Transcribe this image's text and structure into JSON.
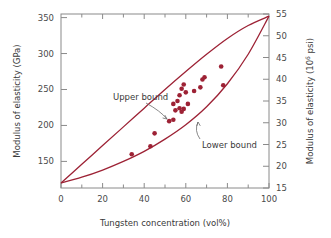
{
  "chart_data": {
    "type": "scatter",
    "title": "",
    "xlabel": "Tungsten concentration (vol%)",
    "ylabel": "Modulus of elasticity (GPa)",
    "ylabel_right": "Modulus of elasticity (10⁶ psi)",
    "ylabel_right_base": "Modulus of elasticity (10",
    "ylabel_right_exp": "6",
    "ylabel_right_tail": " psi)",
    "xlim": [
      0,
      100
    ],
    "ylim": [
      113,
      355
    ],
    "ylim_right": [
      15,
      55
    ],
    "grid": false,
    "legend_position": "inline-annotations",
    "accent_color": "#9d2235",
    "axis_color": "#8a8a8a",
    "text_color": "#3a3a3a",
    "xticks": [
      0,
      20,
      40,
      60,
      80,
      100
    ],
    "xticks_minor": [
      10,
      30,
      50,
      70,
      90
    ],
    "yticks_left": [
      150,
      200,
      250,
      300,
      350
    ],
    "yticks_right": [
      15,
      20,
      25,
      30,
      35,
      40,
      45,
      50,
      55
    ],
    "annotations": [
      {
        "label": "Upper bound",
        "x": 113,
        "y": 100,
        "leader_to_x": 167,
        "leader_to_y": 119
      },
      {
        "label": "Lower bound",
        "x": 202,
        "y": 148,
        "leader_to_x": 198,
        "leader_to_y": 122
      }
    ],
    "series": [
      {
        "name": "Upper bound",
        "type": "line",
        "points": [
          [
            0,
            120
          ],
          [
            10,
            146
          ],
          [
            20,
            172
          ],
          [
            30,
            198
          ],
          [
            40,
            224
          ],
          [
            50,
            250
          ],
          [
            60,
            275
          ],
          [
            70,
            299
          ],
          [
            80,
            321
          ],
          [
            90,
            339
          ],
          [
            100,
            352
          ]
        ]
      },
      {
        "name": "Lower bound",
        "type": "line",
        "points": [
          [
            0,
            120
          ],
          [
            10,
            128
          ],
          [
            20,
            138
          ],
          [
            30,
            150
          ],
          [
            40,
            164
          ],
          [
            50,
            181
          ],
          [
            60,
            201
          ],
          [
            70,
            226
          ],
          [
            80,
            258
          ],
          [
            90,
            299
          ],
          [
            100,
            352
          ]
        ]
      },
      {
        "name": "Experimental data",
        "type": "scatter",
        "points": [
          [
            34,
            160
          ],
          [
            43,
            171
          ],
          [
            45,
            189
          ],
          [
            52,
            206
          ],
          [
            54,
            208
          ],
          [
            54,
            230
          ],
          [
            55,
            221
          ],
          [
            56,
            234
          ],
          [
            57,
            224
          ],
          [
            57,
            242
          ],
          [
            58,
            219
          ],
          [
            58,
            251
          ],
          [
            59,
            223
          ],
          [
            59,
            257
          ],
          [
            60,
            246
          ],
          [
            61,
            230
          ],
          [
            64,
            248
          ],
          [
            67,
            253
          ],
          [
            68,
            264
          ],
          [
            69,
            267
          ],
          [
            77,
            282
          ],
          [
            78,
            256
          ]
        ]
      }
    ]
  }
}
